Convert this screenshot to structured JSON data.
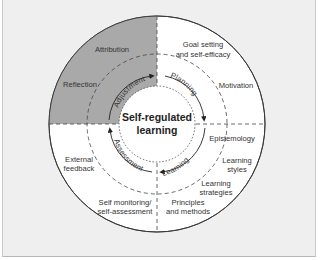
{
  "diagram": {
    "title": "Self-regulated learning",
    "center": {
      "line1": "Self-regulated",
      "line2": "learning"
    },
    "phases": [
      {
        "label": "Planning",
        "quadrant": "top-right"
      },
      {
        "label": "Learning",
        "quadrant": "bottom-right"
      },
      {
        "label": "Assessment",
        "quadrant": "bottom-left"
      },
      {
        "label": "Adjustment",
        "quadrant": "top-left"
      }
    ],
    "outer_labels": {
      "attribution": "Attribution",
      "reflection": "Reflection",
      "goal_line1": "Goal setting",
      "goal_line2": "and self-efficacy",
      "motivation": "Motivation",
      "epistemology": "Epistemology",
      "styles_line1": "Learning",
      "styles_line2": "styles",
      "strategies_line1": "Learning",
      "strategies_line2": "strategies",
      "principles_line1": "Principles",
      "principles_line2": "and methods",
      "monitoring_line1": "Self monitoring/",
      "monitoring_line2": "self-assessment",
      "external_line1": "External",
      "external_line2": "feedback"
    },
    "colors": {
      "highlight_quadrant": "#a9a9a9",
      "circle_fill": "#ffffff",
      "background": "#efefef",
      "stroke": "#333333"
    }
  }
}
